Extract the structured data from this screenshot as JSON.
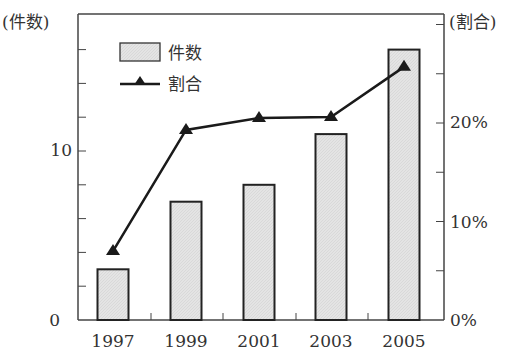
{
  "chart_data": {
    "type": "bar+line",
    "title": "",
    "categories": [
      "1997",
      "1999",
      "2001",
      "2003",
      "2005"
    ],
    "series": [
      {
        "name": "件数",
        "type": "bar",
        "axis": "left",
        "values": [
          3,
          7,
          8,
          11,
          16
        ]
      },
      {
        "name": "割合",
        "type": "line",
        "axis": "right",
        "marker": "triangle",
        "values": [
          7,
          19.3,
          20.5,
          20.6,
          25.7
        ],
        "unit": "%"
      }
    ],
    "left_axis": {
      "label": "(件数)",
      "ylim": [
        0,
        18
      ],
      "tick_labels": [
        "0",
        "10"
      ],
      "tick_values": [
        0,
        10
      ],
      "minor_step": 2
    },
    "right_axis": {
      "label": "(割合)",
      "ylim": [
        0,
        31
      ],
      "tick_labels": [
        "0%",
        "10%",
        "20%"
      ],
      "tick_values": [
        0,
        10,
        20
      ],
      "minor_step": 5
    },
    "xlabel": "",
    "grid": false,
    "legend": {
      "position": "upper-left",
      "entries": [
        "件数",
        "割合"
      ]
    },
    "colors": {
      "bar_fill": "#e2e2e2",
      "bar_stroke": "#222222",
      "line": "#1a1a1a",
      "axis": "#444444"
    }
  }
}
